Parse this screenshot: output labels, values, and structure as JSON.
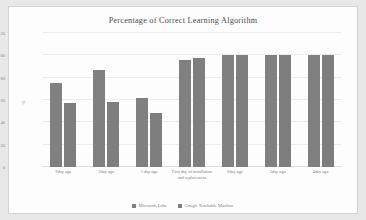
{
  "chart_data": {
    "type": "bar",
    "title": "Percentage of Correct Learning Algorithm",
    "xlabel": "",
    "ylabel": "%",
    "ylim": [
      0,
      120
    ],
    "ytick_values": [
      120,
      100,
      80,
      60,
      40,
      20,
      0
    ],
    "ytick_labels": [
      "120",
      "100",
      "80",
      "60",
      "40",
      "20",
      "0"
    ],
    "grid": true,
    "legend_position": "bottom-center",
    "categories": [
      "9day ago",
      "2day ago",
      "1 day ago",
      "First day of installation and replacement",
      "6day ago",
      "5day ago",
      "4day ago"
    ],
    "series": [
      {
        "name": "Microsoft Lobe",
        "color": "#808080",
        "values": [
          75,
          87,
          62,
          96,
          100,
          100,
          100
        ]
      },
      {
        "name": "Google Teachable Machine",
        "color": "#7e7e7e",
        "values": [
          57,
          58,
          48,
          98,
          100,
          100,
          100
        ]
      }
    ]
  }
}
